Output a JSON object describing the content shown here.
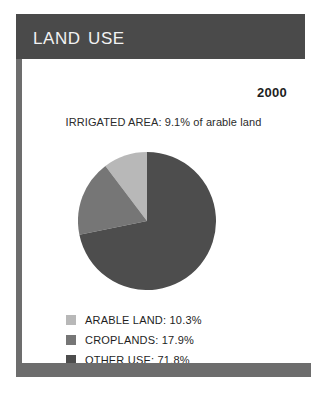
{
  "panel": {
    "title": "LAND USE",
    "year": "2000",
    "irrigated_area_note": "IRRIGATED AREA: 9.1% of arable land",
    "colors": {
      "header_bar": "#4a4a4a",
      "footer_bar": "#6d6d6d",
      "left_rule": "#6d6d6d",
      "background": "#ffffff",
      "title_text": "#f2f2f2",
      "body_text": "#1e1e1e"
    }
  },
  "chart_data": {
    "type": "pie",
    "title": "LAND USE",
    "subtitle": "IRRIGATED AREA: 9.1% of arable land",
    "year": "2000",
    "categories": [
      "ARABLE LAND",
      "CROPLANDS",
      "OTHER USE"
    ],
    "values": [
      10.3,
      17.9,
      71.8
    ],
    "unit": "%",
    "colors": [
      "#b8b8b8",
      "#767676",
      "#4d4d4d"
    ],
    "start_angle_deg": 90,
    "direction": "counterclockwise",
    "legend_position": "bottom-left",
    "grid": false,
    "annotations": [
      "IRRIGATED AREA: 9.1% of arable land"
    ],
    "legend": [
      {
        "label": "ARABLE LAND: 10.3%",
        "name": "ARABLE LAND",
        "value": 10.3,
        "color": "#b8b8b8"
      },
      {
        "label": "CROPLANDS: 17.9%",
        "name": "CROPLANDS",
        "value": 17.9,
        "color": "#767676"
      },
      {
        "label": "OTHER USE: 71.8%",
        "name": "OTHER USE",
        "value": 71.8,
        "color": "#4d4d4d"
      }
    ]
  }
}
